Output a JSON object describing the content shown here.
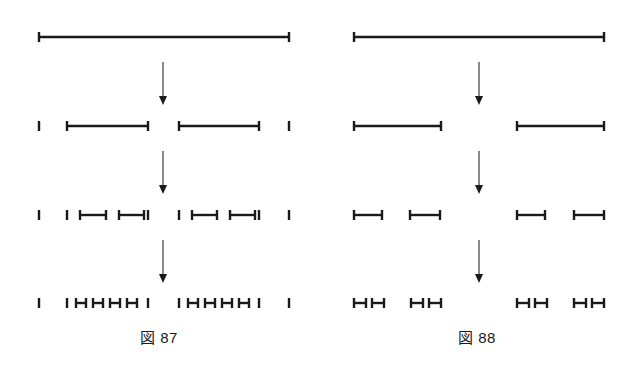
{
  "figure": {
    "background_color": "#ffffff",
    "ink_color": "#1a1a1a",
    "panels": [
      {
        "id": "fig-87",
        "caption": "図 87",
        "caption_label": "図",
        "caption_number": "87",
        "stage_count": 4,
        "arrow_count": 3,
        "description_rows": [
          "1 long segment",
          "2 tick marks and 2 medium segments",
          "6 tick marks and 4 short segments",
          "6 tick marks and 8 very short segments"
        ]
      },
      {
        "id": "fig-88",
        "caption": "図 88",
        "caption_label": "図",
        "caption_number": "88",
        "stage_count": 4,
        "arrow_count": 3,
        "description_rows": [
          "1 long segment",
          "2 medium segments",
          "4 short segments",
          "8 very short segments"
        ]
      }
    ]
  },
  "chart_data": {
    "type": "diagram",
    "title": "",
    "subtitle": "",
    "xlabel": "",
    "ylabel": "",
    "grid": false,
    "legend": "none",
    "panel_width": 318,
    "panel_height": 370,
    "stage_y": [
      37,
      126,
      215,
      303
    ],
    "arrow_y": [
      62,
      105,
      151,
      194,
      240,
      283
    ],
    "stroke_widths": {
      "segment": 2.4,
      "cap": 2.4,
      "cap_half_height": 5
    },
    "panels": [
      {
        "name": "fig-87",
        "caption": "図 87",
        "caption_x": 160,
        "stages": [
          {
            "stage": 1,
            "y": 37,
            "segments": [
              {
                "x1": 39,
                "x2": 289,
                "caps": "both"
              }
            ],
            "ticks": []
          },
          {
            "stage": 2,
            "y": 126,
            "segments": [
              {
                "x1": 67,
                "x2": 148,
                "caps": "both"
              },
              {
                "x1": 179,
                "x2": 259,
                "caps": "both"
              }
            ],
            "ticks": [
              39,
              289
            ]
          },
          {
            "stage": 3,
            "y": 215,
            "segments": [
              {
                "x1": 80,
                "x2": 106,
                "caps": "both"
              },
              {
                "x1": 119,
                "x2": 144,
                "caps": "both"
              },
              {
                "x1": 192,
                "x2": 217,
                "caps": "both"
              },
              {
                "x1": 230,
                "x2": 255,
                "caps": "both"
              }
            ],
            "ticks": [
              39,
              67,
              148,
              179,
              259,
              289
            ]
          },
          {
            "stage": 4,
            "y": 303,
            "segments": [
              {
                "x1": 76,
                "x2": 86,
                "caps": "both"
              },
              {
                "x1": 93,
                "x2": 103,
                "caps": "both"
              },
              {
                "x1": 110,
                "x2": 120,
                "caps": "both"
              },
              {
                "x1": 127,
                "x2": 137,
                "caps": "both"
              },
              {
                "x1": 188,
                "x2": 198,
                "caps": "both"
              },
              {
                "x1": 205,
                "x2": 215,
                "caps": "both"
              },
              {
                "x1": 222,
                "x2": 232,
                "caps": "both"
              },
              {
                "x1": 239,
                "x2": 249,
                "caps": "both"
              }
            ],
            "ticks": [
              39,
              67,
              148,
              179,
              259,
              289
            ]
          }
        ],
        "arrows": [
          {
            "x": 163,
            "y1": 62,
            "y2": 105
          },
          {
            "x": 163,
            "y1": 151,
            "y2": 194
          },
          {
            "x": 163,
            "y1": 240,
            "y2": 283
          }
        ]
      },
      {
        "name": "fig-88",
        "caption": "図 88",
        "caption_x": 160,
        "stages": [
          {
            "stage": 1,
            "y": 37,
            "segments": [
              {
                "x1": 36,
                "x2": 286,
                "caps": "both"
              }
            ],
            "ticks": []
          },
          {
            "stage": 2,
            "y": 126,
            "segments": [
              {
                "x1": 36,
                "x2": 123,
                "caps": "both"
              },
              {
                "x1": 199,
                "x2": 286,
                "caps": "both"
              }
            ],
            "ticks": []
          },
          {
            "stage": 3,
            "y": 215,
            "segments": [
              {
                "x1": 36,
                "x2": 64,
                "caps": "both"
              },
              {
                "x1": 92,
                "x2": 122,
                "caps": "both"
              },
              {
                "x1": 199,
                "x2": 227,
                "caps": "both"
              },
              {
                "x1": 256,
                "x2": 286,
                "caps": "both"
              }
            ],
            "ticks": []
          },
          {
            "stage": 4,
            "y": 303,
            "segments": [
              {
                "x1": 36,
                "x2": 48,
                "caps": "both"
              },
              {
                "x1": 54,
                "x2": 66,
                "caps": "both"
              },
              {
                "x1": 93,
                "x2": 105,
                "caps": "both"
              },
              {
                "x1": 111,
                "x2": 123,
                "caps": "both"
              },
              {
                "x1": 199,
                "x2": 211,
                "caps": "both"
              },
              {
                "x1": 217,
                "x2": 229,
                "caps": "both"
              },
              {
                "x1": 256,
                "x2": 268,
                "caps": "both"
              },
              {
                "x1": 274,
                "x2": 286,
                "caps": "both"
              }
            ],
            "ticks": []
          }
        ],
        "arrows": [
          {
            "x": 161,
            "y1": 62,
            "y2": 105
          },
          {
            "x": 161,
            "y1": 151,
            "y2": 194
          },
          {
            "x": 161,
            "y1": 240,
            "y2": 283
          }
        ]
      }
    ]
  }
}
